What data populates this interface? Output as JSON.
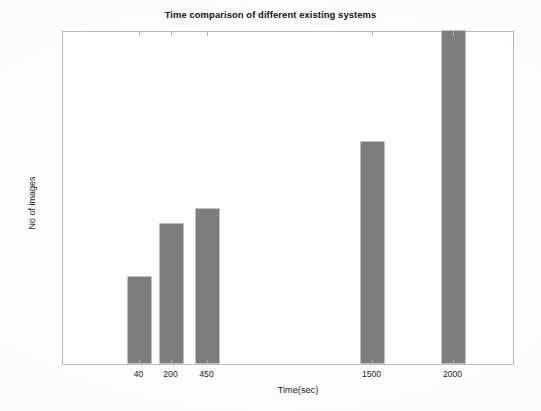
{
  "chart_data": {
    "type": "bar",
    "title": "Time comparison of different existing systems",
    "xlabel": "Time(sec)",
    "ylabel": "No of images",
    "categories": [
      "40",
      "200",
      "450",
      "1500",
      "2000"
    ],
    "values": [
      118,
      190,
      210,
      300,
      450
    ],
    "ylim": [
      0,
      450
    ],
    "yticks": [
      0,
      50,
      100,
      150,
      200,
      250,
      300,
      350,
      400,
      450
    ],
    "ytick_labels": [
      "0",
      "50",
      "100",
      "150",
      "200",
      "250",
      "300",
      "350",
      "400",
      "450"
    ],
    "xtick_labels": [
      "40",
      "200",
      "450",
      "1500",
      "2000"
    ],
    "grid": false,
    "legend": null,
    "bar_color": "#7d7d7d",
    "bar_edge_color": "#c2c2c2",
    "axis_color": "#b9b9b9",
    "background_color": "#ffffff",
    "series": [
      {
        "name": "No of images",
        "values": [
          118,
          190,
          210,
          300,
          450
        ]
      }
    ],
    "bars": [
      {
        "label": "40",
        "value": 118,
        "x_px": 126,
        "width_px": 25
      },
      {
        "label": "200",
        "value": 190,
        "x_px": 158,
        "width_px": 25
      },
      {
        "label": "450",
        "value": 210,
        "x_px": 194,
        "width_px": 25
      },
      {
        "label": "1500",
        "value": 300,
        "x_px": 359,
        "width_px": 25
      },
      {
        "label": "2000",
        "value": 450,
        "x_px": 440,
        "width_px": 25
      }
    ]
  }
}
